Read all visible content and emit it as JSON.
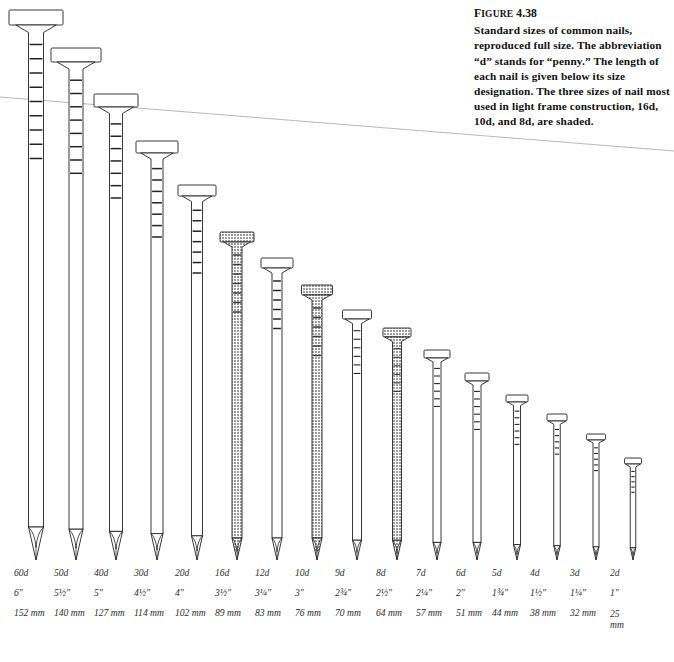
{
  "figure": {
    "number_label": "FIGURE 4.38",
    "number_prefix": "F",
    "number_caps": "IGURE",
    "number_value": "4.38",
    "caption": "Standard sizes of common nails, reproduced full size. The abbreviation “d” stands for “penny.” The length of each nail is given below its size designation. The three sizes of nail most used in light frame construction, 16d, 10d, and 8d, are shaded."
  },
  "colors": {
    "ink": "#1a1a1a",
    "outline": "#222222",
    "shaded_fill": "#b9b9b9",
    "plain_fill": "#ffffff",
    "label_text": "#2b2b2b",
    "hairline": "#9a9aa2"
  },
  "chart_data": {
    "type": "bar",
    "title": "Standard sizes of common nails",
    "xlabel": "",
    "ylabel": "Length",
    "categories": [
      "60d",
      "50d",
      "40d",
      "30d",
      "20d",
      "16d",
      "12d",
      "10d",
      "9d",
      "8d",
      "7d",
      "6d",
      "5d",
      "4d",
      "3d",
      "2d"
    ],
    "values": [
      152,
      140,
      127,
      114,
      102,
      89,
      83,
      76,
      70,
      64,
      57,
      51,
      44,
      38,
      32,
      25
    ],
    "unit": "mm",
    "inches": [
      "6″",
      "5½″",
      "5″",
      "4½″",
      "4″",
      "3½″",
      "3¼″",
      "3″",
      "2¾″",
      "2½″",
      "2¼″",
      "2″",
      "1¾″",
      "1½″",
      "1¼″",
      "1″"
    ],
    "shaded": [
      "16d",
      "10d",
      "8d"
    ],
    "legend_position": "none",
    "grid": false
  },
  "nails": [
    {
      "size": "60d",
      "inch": "6″",
      "mm": "152 mm",
      "shaded": false,
      "x": 36,
      "head_y": 10,
      "tip_y": 560,
      "head_w": 54,
      "head_h": 15,
      "shaft_w": 15,
      "knurls": 9
    },
    {
      "size": "50d",
      "inch": "5½″",
      "mm": "140 mm",
      "shaded": false,
      "x": 76,
      "head_y": 48,
      "tip_y": 560,
      "head_w": 50,
      "head_h": 14,
      "shaft_w": 14,
      "knurls": 8
    },
    {
      "size": "40d",
      "inch": "5″",
      "mm": "127 mm",
      "shaded": false,
      "x": 116,
      "head_y": 94,
      "tip_y": 560,
      "head_w": 44,
      "head_h": 13,
      "shaft_w": 13,
      "knurls": 7
    },
    {
      "size": "30d",
      "inch": "4½″",
      "mm": "114 mm",
      "shaded": false,
      "x": 157,
      "head_y": 141,
      "tip_y": 560,
      "head_w": 42,
      "head_h": 12,
      "shaft_w": 12,
      "knurls": 7
    },
    {
      "size": "20d",
      "inch": "4″",
      "mm": "102 mm",
      "shaded": false,
      "x": 197,
      "head_y": 185,
      "tip_y": 560,
      "head_w": 38,
      "head_h": 11,
      "shaft_w": 11,
      "knurls": 7
    },
    {
      "size": "16d",
      "inch": "3½″",
      "mm": "89 mm",
      "shaded": true,
      "x": 237,
      "head_y": 232,
      "tip_y": 560,
      "head_w": 34,
      "head_h": 10,
      "shaft_w": 10,
      "knurls": 7
    },
    {
      "size": "12d",
      "inch": "3¼″",
      "mm": "83 mm",
      "shaded": false,
      "x": 277,
      "head_y": 258,
      "tip_y": 560,
      "head_w": 32,
      "head_h": 10,
      "shaft_w": 10,
      "knurls": 6
    },
    {
      "size": "10d",
      "inch": "3″",
      "mm": "76 mm",
      "shaded": true,
      "x": 317,
      "head_y": 285,
      "tip_y": 560,
      "head_w": 31,
      "head_h": 10,
      "shaft_w": 10,
      "knurls": 6
    },
    {
      "size": "9d",
      "inch": "2¾″",
      "mm": "70 mm",
      "shaded": false,
      "x": 357,
      "head_y": 310,
      "tip_y": 560,
      "head_w": 29,
      "head_h": 9,
      "shaft_w": 9,
      "knurls": 6
    },
    {
      "size": "8d",
      "inch": "2½″",
      "mm": "64 mm",
      "shaded": true,
      "x": 397,
      "head_y": 328,
      "tip_y": 560,
      "head_w": 28,
      "head_h": 9,
      "shaft_w": 9,
      "knurls": 6
    },
    {
      "size": "7d",
      "inch": "2¼″",
      "mm": "57 mm",
      "shaded": false,
      "x": 437,
      "head_y": 350,
      "tip_y": 560,
      "head_w": 26,
      "head_h": 8,
      "shaft_w": 8,
      "knurls": 6
    },
    {
      "size": "6d",
      "inch": "2″",
      "mm": "51 mm",
      "shaded": false,
      "x": 477,
      "head_y": 373,
      "tip_y": 560,
      "head_w": 24,
      "head_h": 8,
      "shaft_w": 8,
      "knurls": 6
    },
    {
      "size": "5d",
      "inch": "1¾″",
      "mm": "44 mm",
      "shaded": false,
      "x": 517,
      "head_y": 395,
      "tip_y": 560,
      "head_w": 22,
      "head_h": 7,
      "shaft_w": 7,
      "knurls": 6
    },
    {
      "size": "4d",
      "inch": "1½″",
      "mm": "38 mm",
      "shaded": false,
      "x": 557,
      "head_y": 414,
      "tip_y": 560,
      "head_w": 20,
      "head_h": 7,
      "shaft_w": 6.5,
      "knurls": 5
    },
    {
      "size": "3d",
      "inch": "1¼″",
      "mm": "32 mm",
      "shaded": false,
      "x": 596,
      "head_y": 434,
      "tip_y": 560,
      "head_w": 19,
      "head_h": 6,
      "shaft_w": 6,
      "knurls": 5
    },
    {
      "size": "2d",
      "inch": "1″",
      "mm": "25 mm",
      "shaded": false,
      "x": 633,
      "head_y": 458,
      "tip_y": 560,
      "head_w": 17,
      "head_h": 6,
      "shaft_w": 5.5,
      "knurls": 5
    }
  ],
  "hairline": {
    "x1": 0,
    "y1": 97,
    "x2": 674,
    "y2": 151
  },
  "label_columns_left": [
    14,
    54,
    94,
    134,
    175,
    215,
    255,
    295,
    335,
    376,
    416,
    456,
    492,
    530,
    570,
    610
  ]
}
